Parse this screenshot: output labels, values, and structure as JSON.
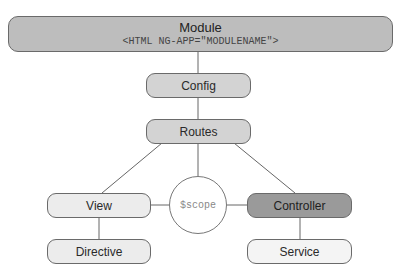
{
  "diagram": {
    "module": {
      "title": "Module",
      "code": "<HTML NG-APP=\"MODULENAME\">"
    },
    "nodes": {
      "config": "Config",
      "routes": "Routes",
      "view": "View",
      "directive": "Directive",
      "scope": "$scope",
      "controller": "Controller",
      "service": "Service"
    },
    "edges": [
      [
        "module",
        "config"
      ],
      [
        "config",
        "routes"
      ],
      [
        "routes",
        "view"
      ],
      [
        "routes",
        "scope"
      ],
      [
        "routes",
        "controller"
      ],
      [
        "view",
        "scope"
      ],
      [
        "scope",
        "controller"
      ],
      [
        "view",
        "directive"
      ],
      [
        "controller",
        "service"
      ]
    ]
  }
}
